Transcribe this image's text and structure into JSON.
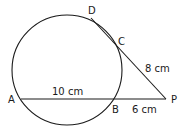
{
  "diagram": {
    "type": "circle-secants",
    "points": {
      "A": {
        "label": "A",
        "x": 21,
        "y": 99
      },
      "B": {
        "label": "B",
        "x": 115,
        "y": 99
      },
      "C": {
        "label": "C",
        "x": 115,
        "y": 42
      },
      "D": {
        "label": "D",
        "x": 91,
        "y": 17
      },
      "P": {
        "label": "P",
        "x": 166,
        "y": 99
      }
    },
    "circle": {
      "cx": 67,
      "cy": 70,
      "r": 55
    },
    "labels": {
      "AB": "10 cm",
      "BP": "6 cm",
      "CP": "8 cm"
    },
    "stroke_color": "#1a1a1a"
  }
}
